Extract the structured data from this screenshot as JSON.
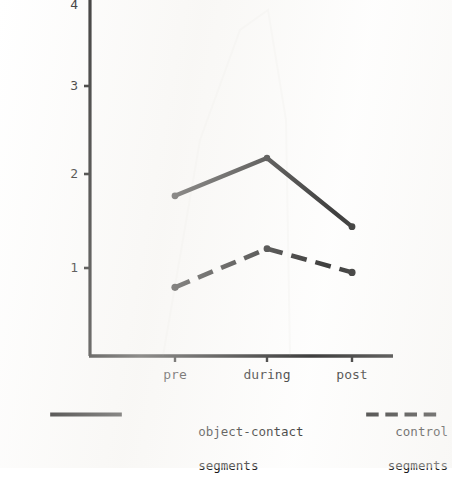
{
  "chart_data": {
    "type": "line",
    "title": "",
    "subtitle": "",
    "xlabel": "",
    "ylabel": "",
    "categories": [
      "pre",
      "during",
      "post"
    ],
    "x_tick_labels": [
      "pre",
      "during",
      "post"
    ],
    "y_tick_labels": [
      "1",
      "2",
      "3",
      "4"
    ],
    "y_ticks": [
      1,
      2,
      3,
      4
    ],
    "ylim": [
      0,
      4.05
    ],
    "xlim": [
      -0.55,
      2.5
    ],
    "grid": false,
    "legend_position": "below-plot",
    "series": [
      {
        "name": "object-contact\nsegments",
        "name_line1": "object-contact",
        "name_line2": "segments",
        "style": "solid",
        "color": "#111111",
        "marker": "dot",
        "values": [
          1.82,
          2.25,
          1.47
        ]
      },
      {
        "name": "control\nsegments",
        "name_line1": "control",
        "name_line2": "segments",
        "style": "dashed",
        "color": "#111111",
        "marker": "dot",
        "values": [
          0.78,
          1.22,
          0.95
        ]
      }
    ],
    "annotations": []
  },
  "axes": {
    "y_axis_label_4": "4",
    "y_axis_label_3": "3",
    "y_axis_label_2": "2",
    "y_axis_label_1": "1",
    "x_axis_label_pre": "pre",
    "x_axis_label_during": "during",
    "x_axis_label_post": "post"
  },
  "legend": {
    "entries": [
      {
        "line1": "object-contact",
        "line2": "segments",
        "style": "solid"
      },
      {
        "line1": "control",
        "line2": "segments",
        "style": "dashed"
      }
    ]
  },
  "colors": {
    "ink": "#111111",
    "page": "#ffffff"
  }
}
